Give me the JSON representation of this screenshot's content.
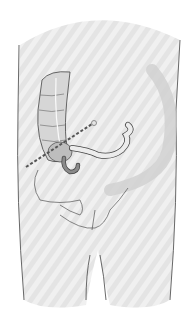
{
  "figure": {
    "title": "",
    "colors": {
      "background": "#ffffff",
      "body_fill": "#e6e6e6",
      "stripe": "#f2f2f2",
      "outline": "#444444",
      "colon_fill": "#d2d2d2",
      "appendix_fill": "#8a8a8a",
      "dotted_line": "#555555",
      "shadow": "#cfcfcf"
    },
    "annotations": {
      "dotted_line": "line-from-iliac-spine-to-umbilicus",
      "marker": "umbilicus-marker-circle"
    }
  }
}
